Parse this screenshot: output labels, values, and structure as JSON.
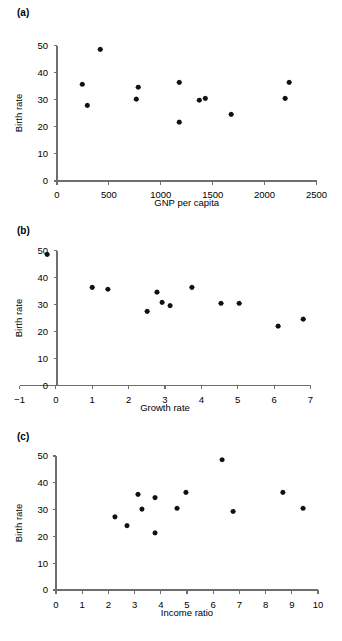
{
  "figure": {
    "background": "#ffffff",
    "marker_color": "#111111",
    "axis_color": "#6e6e6e",
    "panels": [
      {
        "id": "a",
        "label": "(a)",
        "chart_index": 0
      },
      {
        "id": "b",
        "label": "(b)",
        "chart_index": 1
      },
      {
        "id": "c",
        "label": "(c)",
        "chart_index": 2
      }
    ]
  },
  "chart_data": [
    {
      "type": "scatter",
      "panel": "(a)",
      "title": "",
      "xlabel": "GNP per capita",
      "ylabel": "Birth rate",
      "xlim": [
        0,
        2500
      ],
      "ylim": [
        0,
        50
      ],
      "xticks": [
        0,
        500,
        1000,
        1500,
        2000,
        2500
      ],
      "yticks": [
        0,
        10,
        20,
        30,
        40,
        50
      ],
      "xtick_labels": [
        "0",
        "500",
        "1000",
        "1500",
        "2000",
        "2500"
      ],
      "ytick_labels": [
        "0",
        "10",
        "20",
        "30",
        "40",
        "50"
      ],
      "grid": false,
      "legend": "none",
      "series": [
        {
          "name": "countries",
          "x": [
            244,
            292,
            417,
            764,
            783,
            1178,
            1178,
            1371,
            1429,
            1678,
            2198,
            2237
          ],
          "y": [
            35.7,
            27.9,
            48.6,
            30.2,
            34.6,
            21.7,
            36.4,
            29.8,
            30.5,
            24.6,
            30.5,
            36.4
          ]
        }
      ]
    },
    {
      "type": "scatter",
      "panel": "(b)",
      "title": "",
      "xlabel": "Growth rate",
      "ylabel": "Birth rate",
      "xlim": [
        -1,
        7
      ],
      "ylim": [
        0,
        50
      ],
      "xticks": [
        -1,
        0,
        1,
        2,
        3,
        4,
        5,
        6,
        7
      ],
      "yticks": [
        0,
        10,
        20,
        30,
        40,
        50
      ],
      "xtick_labels": [
        "−1",
        "0",
        "1",
        "2",
        "3",
        "4",
        "5",
        "6",
        "7"
      ],
      "ytick_labels": [
        "0",
        "10",
        "20",
        "30",
        "40",
        "50"
      ],
      "grid": false,
      "legend": "none",
      "series": [
        {
          "name": "countries",
          "x": [
            -0.24,
            1.0,
            1.43,
            2.51,
            2.78,
            2.92,
            3.14,
            3.74,
            4.54,
            5.04,
            6.11,
            6.8
          ],
          "y": [
            48.6,
            36.4,
            35.7,
            27.5,
            34.6,
            30.8,
            29.6,
            36.4,
            30.5,
            30.5,
            22.0,
            24.6
          ]
        }
      ]
    },
    {
      "type": "scatter",
      "panel": "(c)",
      "title": "",
      "xlabel": "Income ratio",
      "ylabel": "Birth rate",
      "xlim": [
        0,
        10
      ],
      "ylim": [
        0,
        50
      ],
      "xticks": [
        0,
        1,
        2,
        3,
        4,
        5,
        6,
        7,
        8,
        9,
        10
      ],
      "yticks": [
        0,
        10,
        20,
        30,
        40,
        50
      ],
      "xtick_labels": [
        "0",
        "1",
        "2",
        "3",
        "4",
        "5",
        "6",
        "7",
        "8",
        "9",
        "10"
      ],
      "ytick_labels": [
        "0",
        "10",
        "20",
        "30",
        "40",
        "50"
      ],
      "grid": false,
      "legend": "none",
      "series": [
        {
          "name": "countries",
          "x": [
            2.25,
            2.71,
            3.13,
            3.28,
            3.78,
            3.78,
            4.62,
            4.96,
            6.34,
            6.76,
            8.66,
            9.43
          ],
          "y": [
            27.3,
            24.0,
            35.7,
            30.2,
            21.3,
            34.5,
            30.5,
            36.4,
            48.6,
            29.3,
            36.4,
            30.5
          ]
        }
      ]
    }
  ]
}
